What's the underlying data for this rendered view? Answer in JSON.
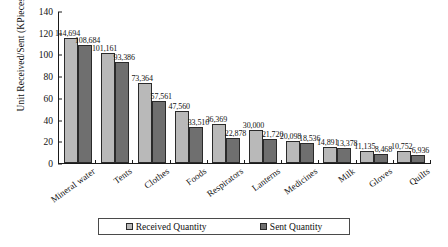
{
  "chart_data": {
    "type": "bar",
    "title": "",
    "xlabel": "",
    "ylabel": "Unit Received/Sent (KPieces)",
    "ylim": [
      0,
      140
    ],
    "ytick_step": 20,
    "yticks": [
      "140",
      "120",
      "100",
      "80",
      "60",
      "40",
      "20",
      "0"
    ],
    "grid": false,
    "legend_position": "bottom",
    "value_unit_divisor": 1000,
    "categories": [
      "Mineral water",
      "Tents",
      "Clothes",
      "Foods",
      "Respirators",
      "Lanterns",
      "Medicines",
      "Milk",
      "Gloves",
      "Quilts"
    ],
    "series": [
      {
        "name": "Received Quantity",
        "color": "#b9b9b9",
        "values": [
          114694,
          101161,
          73364,
          47560,
          36369,
          30000,
          20098,
          14891,
          11135,
          10752
        ],
        "labels": [
          "114,694",
          "101,161",
          "73,364",
          "47,560",
          "36,369",
          "30,000",
          "20,098",
          "14,891",
          "11,135",
          "10,752"
        ]
      },
      {
        "name": "Sent Quantity",
        "color": "#6f6f6f",
        "values": [
          108684,
          93386,
          57561,
          33510,
          22878,
          21720,
          18536,
          13378,
          8468,
          6936
        ],
        "labels": [
          "108,684",
          "93,386",
          "57,561",
          "33,510",
          "22,878",
          "21,720",
          "18,536",
          "13,378",
          "8,468",
          "6,936"
        ]
      }
    ]
  }
}
